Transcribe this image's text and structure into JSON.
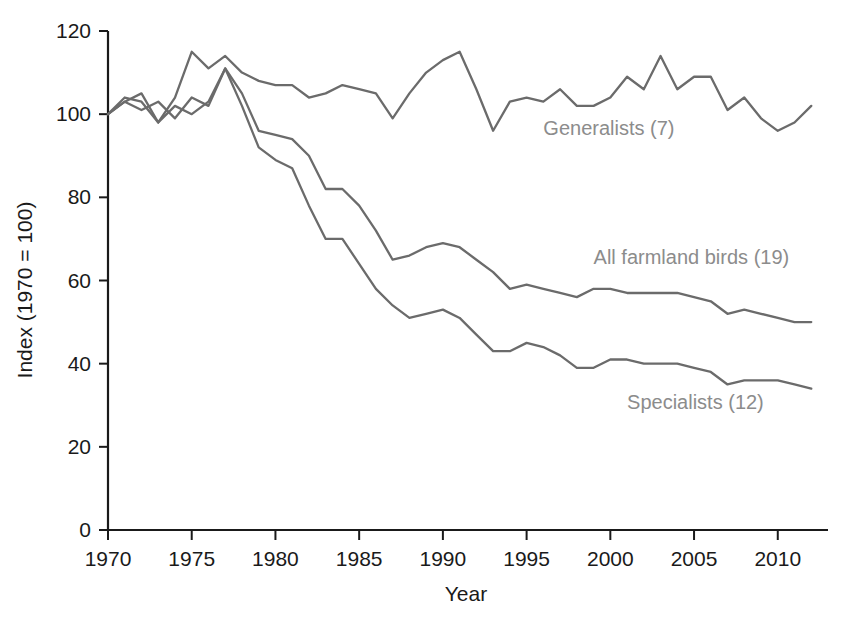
{
  "chart_data": {
    "type": "line",
    "title": "",
    "xlabel": "Year",
    "ylabel": "Index (1970 = 100)",
    "xlim": [
      1970,
      2013
    ],
    "ylim": [
      0,
      120
    ],
    "xticks": [
      1970,
      1975,
      1980,
      1985,
      1990,
      1995,
      2000,
      2005,
      2010
    ],
    "yticks": [
      0,
      20,
      40,
      60,
      80,
      100,
      120
    ],
    "grid": false,
    "legend_position": "inline-labels",
    "line_color": "#6b6b6b",
    "label_color": "#8c8c8c",
    "axis_color": "#1a1a1a",
    "x": [
      1970,
      1971,
      1972,
      1973,
      1974,
      1975,
      1976,
      1977,
      1978,
      1979,
      1980,
      1981,
      1982,
      1983,
      1984,
      1985,
      1986,
      1987,
      1988,
      1989,
      1990,
      1991,
      1992,
      1993,
      1994,
      1995,
      1996,
      1997,
      1998,
      1999,
      2000,
      2001,
      2002,
      2003,
      2004,
      2005,
      2006,
      2007,
      2008,
      2009,
      2010,
      2011,
      2012
    ],
    "series": [
      {
        "name": "Generalists (7)",
        "label": "Generalists (7)",
        "label_x": 1996,
        "label_y": 95,
        "values": [
          100,
          103,
          105,
          98,
          104,
          115,
          111,
          114,
          110,
          108,
          107,
          107,
          104,
          105,
          107,
          106,
          105,
          99,
          105,
          110,
          113,
          115,
          106,
          96,
          103,
          104,
          103,
          106,
          102,
          102,
          104,
          109,
          106,
          114,
          106,
          109,
          109,
          101,
          104,
          99,
          96,
          98,
          102
        ]
      },
      {
        "name": "All farmland birds (19)",
        "label": "All farmland birds (19)",
        "label_x": 1999,
        "label_y": 64,
        "values": [
          100,
          103,
          101,
          103,
          99,
          104,
          102,
          111,
          105,
          96,
          95,
          94,
          90,
          82,
          82,
          78,
          72,
          65,
          66,
          68,
          69,
          68,
          65,
          62,
          58,
          59,
          58,
          57,
          56,
          58,
          58,
          57,
          57,
          57,
          57,
          56,
          55,
          52,
          53,
          52,
          51,
          50,
          50
        ]
      },
      {
        "name": "Specialists (12)",
        "label": "Specialists (12)",
        "label_x": 2001,
        "label_y": 29,
        "values": [
          100,
          104,
          103,
          98,
          102,
          100,
          103,
          111,
          102,
          92,
          89,
          87,
          78,
          70,
          70,
          64,
          58,
          54,
          51,
          52,
          53,
          51,
          47,
          43,
          43,
          45,
          44,
          42,
          39,
          39,
          41,
          41,
          40,
          40,
          40,
          39,
          38,
          35,
          36,
          36,
          36,
          35,
          34
        ]
      }
    ]
  }
}
